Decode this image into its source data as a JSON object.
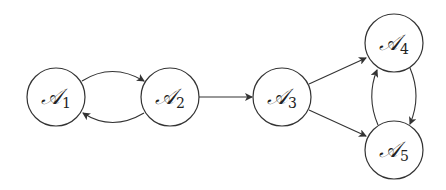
{
  "diagram": {
    "type": "directed-graph",
    "stroke_color": "#333333",
    "nodes": [
      {
        "id": "A1",
        "symbol": "𝒜",
        "subscript": "1",
        "x": 56,
        "y": 97
      },
      {
        "id": "A2",
        "symbol": "𝒜",
        "subscript": "2",
        "x": 170,
        "y": 97
      },
      {
        "id": "A3",
        "symbol": "𝒜",
        "subscript": "3",
        "x": 282,
        "y": 97
      },
      {
        "id": "A4",
        "symbol": "𝒜",
        "subscript": "4",
        "x": 394,
        "y": 43
      },
      {
        "id": "A5",
        "symbol": "𝒜",
        "subscript": "5",
        "x": 394,
        "y": 150
      }
    ],
    "edges": [
      {
        "from": "A1",
        "to": "A2",
        "style": "curved-up"
      },
      {
        "from": "A2",
        "to": "A1",
        "style": "curved-down"
      },
      {
        "from": "A2",
        "to": "A3",
        "style": "straight"
      },
      {
        "from": "A3",
        "to": "A4",
        "style": "straight"
      },
      {
        "from": "A3",
        "to": "A5",
        "style": "straight"
      },
      {
        "from": "A4",
        "to": "A5",
        "style": "curved-right"
      },
      {
        "from": "A5",
        "to": "A4",
        "style": "curved-left"
      }
    ]
  }
}
